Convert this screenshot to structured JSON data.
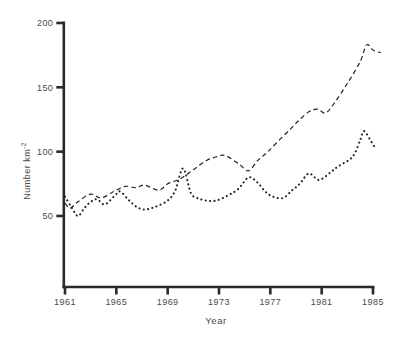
{
  "chart_data": {
    "type": "line",
    "title": "",
    "xlabel": "Year",
    "ylabel": {
      "base": "Number km",
      "exponent": "-2"
    },
    "x_ticks": [
      "1961",
      "1965",
      "1969",
      "1973",
      "1977",
      "1981",
      "1985"
    ],
    "y_ticks": [
      "50",
      "100",
      "150",
      "200"
    ],
    "xlim": [
      1961,
      1985
    ],
    "ylim": [
      0,
      200
    ],
    "grid": false,
    "legend": "none",
    "background": "#ffffff",
    "ink_color": "#2a2a2a",
    "text_color": "#4a4a4a",
    "series": [
      {
        "name": "upper-dashed",
        "line_style": "dashed",
        "points": [
          [
            1961,
            60
          ],
          [
            1961.4,
            56
          ],
          [
            1962,
            61
          ],
          [
            1963,
            67
          ],
          [
            1963.8,
            64
          ],
          [
            1964.8,
            69
          ],
          [
            1965.7,
            73
          ],
          [
            1966.5,
            72
          ],
          [
            1967.2,
            74
          ],
          [
            1968.3,
            70
          ],
          [
            1969,
            75
          ],
          [
            1970,
            79
          ],
          [
            1971,
            86
          ],
          [
            1972,
            93
          ],
          [
            1972.8,
            96
          ],
          [
            1973.5,
            97
          ],
          [
            1974.6,
            90
          ],
          [
            1975.3,
            85
          ],
          [
            1976,
            93
          ],
          [
            1976.7,
            99
          ],
          [
            1977.5,
            107
          ],
          [
            1978.5,
            117
          ],
          [
            1979.2,
            124
          ],
          [
            1980,
            131
          ],
          [
            1980.7,
            133
          ],
          [
            1981.3,
            130
          ],
          [
            1982,
            138
          ],
          [
            1983,
            153
          ],
          [
            1984,
            170
          ],
          [
            1984.5,
            183
          ],
          [
            1985,
            179
          ],
          [
            1985.6,
            177
          ]
        ]
      },
      {
        "name": "lower-dotted",
        "line_style": "dotted",
        "points": [
          [
            1961,
            65
          ],
          [
            1961.5,
            57
          ],
          [
            1962,
            50
          ],
          [
            1962.5,
            56
          ],
          [
            1963,
            61
          ],
          [
            1963.5,
            63
          ],
          [
            1964.1,
            59
          ],
          [
            1964.9,
            66
          ],
          [
            1965.3,
            69
          ],
          [
            1966,
            62
          ],
          [
            1966.6,
            57
          ],
          [
            1967.2,
            55
          ],
          [
            1968,
            57
          ],
          [
            1969,
            62
          ],
          [
            1969.6,
            70
          ],
          [
            1970.2,
            87
          ],
          [
            1970.8,
            68
          ],
          [
            1971.3,
            64
          ],
          [
            1972,
            62
          ],
          [
            1972.8,
            62
          ],
          [
            1973.7,
            66
          ],
          [
            1974.5,
            71
          ],
          [
            1975.3,
            80
          ],
          [
            1976,
            76
          ],
          [
            1976.6,
            69
          ],
          [
            1977.2,
            65
          ],
          [
            1978,
            64
          ],
          [
            1978.7,
            70
          ],
          [
            1979.3,
            75
          ],
          [
            1980,
            83
          ],
          [
            1980.8,
            78
          ],
          [
            1981.7,
            84
          ],
          [
            1982.2,
            88
          ],
          [
            1982.7,
            91
          ],
          [
            1983.2,
            94
          ],
          [
            1983.6,
            99
          ],
          [
            1984,
            109
          ],
          [
            1984.3,
            116
          ],
          [
            1984.8,
            109
          ],
          [
            1985.1,
            104
          ]
        ]
      }
    ]
  }
}
